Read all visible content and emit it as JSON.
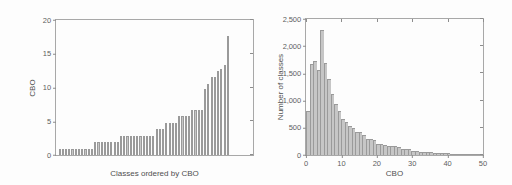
{
  "figure": {
    "background": "#fdfdfd",
    "bar_fill": "#c6c6c6",
    "bar_edge": "#9a9a9a",
    "axis_color": "#a8a8a8",
    "text_color": "#5a5a5a"
  },
  "chart_data": [
    {
      "id": "left",
      "type": "bar",
      "title": "",
      "xlabel": "Classes ordered by CBO",
      "ylabel": "CBO",
      "xlim": [
        0,
        60
      ],
      "ylim": [
        0,
        20
      ],
      "yticks": [
        0,
        5,
        10,
        15,
        20
      ],
      "ytick_labels": [
        "0",
        "5",
        "10",
        "15",
        "20"
      ],
      "xticks": [],
      "xtick_labels": [],
      "grid": false,
      "legend": "none",
      "categories": [
        "1",
        "2",
        "3",
        "4",
        "5",
        "6",
        "7",
        "8",
        "9",
        "10",
        "11",
        "12",
        "13",
        "14",
        "15",
        "16",
        "17",
        "18",
        "19",
        "20",
        "21",
        "22",
        "23",
        "24",
        "25",
        "26",
        "27",
        "28",
        "29",
        "30",
        "31",
        "32",
        "33",
        "34",
        "35",
        "36",
        "37",
        "38",
        "39",
        "40",
        "41",
        "42",
        "43",
        "44",
        "45",
        "46",
        "47",
        "48",
        "49",
        "50",
        "51",
        "52",
        "53",
        "54",
        "55",
        "56",
        "57",
        "58",
        "59",
        "60"
      ],
      "values": [
        0.9,
        0.9,
        0.9,
        0.9,
        0.9,
        0.9,
        0.9,
        0.9,
        0.9,
        0.9,
        0.9,
        1.9,
        1.9,
        1.9,
        1.9,
        1.9,
        1.9,
        1.9,
        1.9,
        2.8,
        2.8,
        2.8,
        2.8,
        2.8,
        2.8,
        2.8,
        2.8,
        2.8,
        2.8,
        2.8,
        3.8,
        3.8,
        3.8,
        4.8,
        4.8,
        4.8,
        4.8,
        5.8,
        5.8,
        5.8,
        5.8,
        6.7,
        6.7,
        6.7,
        6.7,
        9.8,
        10.5,
        11.6,
        11.6,
        12.5,
        12.8,
        13.4,
        17.7,
        0,
        0,
        0,
        0,
        0,
        0,
        0
      ]
    },
    {
      "id": "right",
      "type": "bar",
      "title": "",
      "xlabel": "CBO",
      "ylabel": "Number of classes",
      "xlim": [
        0,
        50
      ],
      "ylim": [
        0,
        2500
      ],
      "yticks": [
        0,
        500,
        1000,
        1500,
        2000,
        2500
      ],
      "ytick_labels": [
        "0",
        "500",
        "1,000",
        "1,500",
        "2,000",
        "2,500"
      ],
      "xticks": [
        0,
        10,
        20,
        30,
        40,
        50
      ],
      "xtick_labels": [
        "0",
        "10",
        "20",
        "30",
        "40",
        "50"
      ],
      "grid": false,
      "legend": "none",
      "bin_width": 1,
      "x": [
        0,
        1,
        2,
        3,
        4,
        5,
        6,
        7,
        8,
        9,
        10,
        11,
        12,
        13,
        14,
        15,
        16,
        17,
        18,
        19,
        20,
        21,
        22,
        23,
        24,
        25,
        26,
        27,
        28,
        29,
        30,
        31,
        32,
        33,
        34,
        35,
        36,
        37,
        38,
        39,
        40,
        41,
        42,
        43,
        44,
        45,
        46,
        47,
        48,
        49
      ],
      "values": [
        800,
        1680,
        1720,
        1560,
        2290,
        1690,
        1390,
        1130,
        940,
        800,
        660,
        600,
        530,
        490,
        430,
        430,
        360,
        300,
        290,
        270,
        210,
        200,
        190,
        170,
        160,
        170,
        140,
        110,
        110,
        110,
        80,
        70,
        60,
        60,
        55,
        50,
        45,
        40,
        35,
        30,
        28,
        25,
        22,
        20,
        18,
        15,
        12,
        10,
        8,
        6
      ]
    }
  ]
}
